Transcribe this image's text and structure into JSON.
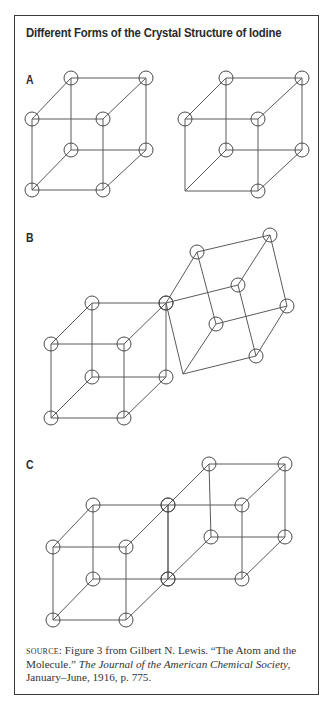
{
  "figure": {
    "title": "Different Forms of the Crystal Structure of Iodine",
    "colors": {
      "frame": "#3a3a3a",
      "line": "#5a5a5a",
      "circle": "#4a4a4a",
      "text": "#2a2a2a",
      "background": "#ffffff"
    },
    "atom_radius": 7,
    "panels": [
      {
        "label": "A",
        "label_pos": [
          26,
          72
        ],
        "description": "Two simple cubic arrangements of iodine atoms",
        "cubes": [
          {
            "vertices": [
              [
                71,
                78
              ],
              [
                146,
                78
              ],
              [
                32,
                119
              ],
              [
                103,
                119
              ],
              [
                71,
                150
              ],
              [
                146,
                150
              ],
              [
                32,
                190
              ],
              [
                103,
                190
              ]
            ],
            "atoms": [
              0,
              1,
              2,
              3,
              4,
              5,
              6,
              7
            ],
            "edges": [
              [
                0,
                1
              ],
              [
                2,
                3
              ],
              [
                0,
                2
              ],
              [
                1,
                3
              ],
              [
                4,
                5
              ],
              [
                6,
                7
              ],
              [
                4,
                6
              ],
              [
                5,
                7
              ],
              [
                0,
                4
              ],
              [
                1,
                5
              ],
              [
                2,
                6
              ],
              [
                3,
                7
              ]
            ]
          },
          {
            "vertices": [
              [
                226,
                78
              ],
              [
                302,
                78
              ],
              [
                185,
                119
              ],
              [
                258,
                119
              ],
              [
                226,
                150
              ],
              [
                302,
                150
              ],
              [
                185,
                191
              ],
              [
                258,
                191
              ]
            ],
            "atoms": [
              0,
              1,
              2,
              3,
              4,
              5,
              7
            ],
            "edges": [
              [
                0,
                1
              ],
              [
                2,
                3
              ],
              [
                0,
                2
              ],
              [
                1,
                3
              ],
              [
                4,
                5
              ],
              [
                6,
                7
              ],
              [
                4,
                6
              ],
              [
                5,
                7
              ],
              [
                0,
                4
              ],
              [
                1,
                5
              ],
              [
                2,
                6
              ],
              [
                3,
                7
              ]
            ]
          }
        ]
      },
      {
        "label": "B",
        "label_pos": [
          26,
          230
        ],
        "description": "A cube joined at a corner to a rotated cube",
        "cubes": [
          {
            "vertices": [
              [
                92,
                303
              ],
              [
                166,
                303
              ],
              [
                51,
                344
              ],
              [
                124,
                344
              ],
              [
                92,
                377
              ],
              [
                166,
                377
              ],
              [
                51,
                418
              ],
              [
                124,
                418
              ]
            ],
            "atoms": [
              0,
              1,
              2,
              3,
              4,
              5,
              6,
              7
            ],
            "edges": [
              [
                0,
                1
              ],
              [
                2,
                3
              ],
              [
                0,
                2
              ],
              [
                1,
                3
              ],
              [
                4,
                5
              ],
              [
                6,
                7
              ],
              [
                4,
                6
              ],
              [
                5,
                7
              ],
              [
                0,
                4
              ],
              [
                1,
                5
              ],
              [
                2,
                6
              ],
              [
                3,
                7
              ]
            ]
          },
          {
            "vertices": [
              [
                197,
                252
              ],
              [
                270,
                235
              ],
              [
                166,
                303
              ],
              [
                238,
                285
              ],
              [
                216,
                324
              ],
              [
                287,
                306
              ],
              [
                183,
                374
              ],
              [
                256,
                356
              ]
            ],
            "atoms": [
              0,
              1,
              2,
              3,
              4,
              5,
              7
            ],
            "edges": [
              [
                0,
                1
              ],
              [
                2,
                3
              ],
              [
                0,
                2
              ],
              [
                1,
                3
              ],
              [
                4,
                5
              ],
              [
                6,
                7
              ],
              [
                4,
                6
              ],
              [
                5,
                7
              ],
              [
                0,
                4
              ],
              [
                1,
                5
              ],
              [
                2,
                6
              ],
              [
                3,
                7
              ]
            ]
          }
        ]
      },
      {
        "label": "C",
        "label_pos": [
          26,
          457
        ],
        "description": "Two cubes sharing a face offset into an extended lattice",
        "cubes": [
          {
            "vertices": [
              [
                93,
                505
              ],
              [
                168,
                505
              ],
              [
                53,
                547
              ],
              [
                126,
                547
              ],
              [
                93,
                579
              ],
              [
                168,
                579
              ],
              [
                53,
                620
              ],
              [
                126,
                620
              ]
            ],
            "atoms": [
              0,
              1,
              2,
              3,
              4,
              5,
              6,
              7
            ],
            "edges": [
              [
                0,
                1
              ],
              [
                2,
                3
              ],
              [
                0,
                2
              ],
              [
                1,
                3
              ],
              [
                4,
                5
              ],
              [
                6,
                7
              ],
              [
                4,
                6
              ],
              [
                5,
                7
              ],
              [
                0,
                4
              ],
              [
                1,
                5
              ],
              [
                2,
                6
              ],
              [
                3,
                7
              ]
            ]
          },
          {
            "vertices": [
              [
                209,
                464
              ],
              [
                285,
                464
              ],
              [
                168,
                505
              ],
              [
                242,
                505
              ],
              [
                211,
                537
              ],
              [
                285,
                537
              ],
              [
                168,
                579
              ],
              [
                242,
                579
              ]
            ],
            "atoms": [
              0,
              1,
              2,
              3,
              4,
              5,
              6,
              7
            ],
            "edges": [
              [
                0,
                1
              ],
              [
                2,
                3
              ],
              [
                0,
                2
              ],
              [
                1,
                3
              ],
              [
                4,
                5
              ],
              [
                6,
                7
              ],
              [
                4,
                6
              ],
              [
                5,
                7
              ],
              [
                0,
                4
              ],
              [
                1,
                5
              ],
              [
                2,
                6
              ],
              [
                3,
                7
              ]
            ]
          }
        ]
      }
    ],
    "source": {
      "tag": "Source:",
      "text_1": " Figure 3 from Gilbert N. Lewis. “The Atom and the Molecule.” ",
      "journal": "The Journal of the American Chemical Society,",
      "text_2": " January–June, 1916, p. 775."
    }
  }
}
